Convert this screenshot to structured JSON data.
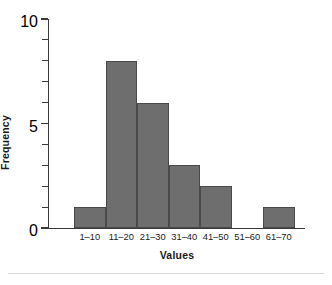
{
  "chart_data": {
    "type": "bar",
    "title": "",
    "subtitle": "",
    "xlabel": "Values",
    "ylabel": "Frequency",
    "categories": [
      "1–10",
      "11–20",
      "21–30",
      "31–40",
      "41–50",
      "51–60",
      "61–70"
    ],
    "values": [
      1,
      8,
      6,
      3,
      2,
      0,
      1
    ],
    "series": [
      {
        "name": "Frequency",
        "values": [
          1,
          8,
          6,
          3,
          2,
          0,
          1
        ]
      }
    ],
    "ylim": [
      0,
      10
    ],
    "y_major_ticks": [
      0,
      5,
      10
    ],
    "y_major_tick_labels": [
      "0",
      "5",
      "10"
    ],
    "y_minor_ticks": [
      1,
      2,
      3,
      4,
      6,
      7,
      8,
      9
    ],
    "grid": false,
    "legend": null,
    "legend_position": "none",
    "bar_color": "#6e6e6e",
    "bar_edge_color": "#4a4a4a",
    "axis_color": "#3a3a3a",
    "background_color": "#ffffff",
    "text_color": "#1a1a1a",
    "bar_gap": 0,
    "annotations": []
  }
}
